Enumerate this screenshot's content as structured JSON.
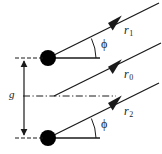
{
  "figure": {
    "background_color": "#ffffff",
    "line_color": "#1a1a1a",
    "source_color": "#000000",
    "width": 162,
    "height": 154
  },
  "labels": {
    "ray_upper": {
      "symbol": "r",
      "subscript": "1",
      "text": "r1"
    },
    "ray_center": {
      "symbol": "r",
      "subscript": "0",
      "text": "r0"
    },
    "ray_lower": {
      "symbol": "r",
      "subscript": "2",
      "text": "r2"
    },
    "gap": {
      "text": "g"
    },
    "angle_upper": {
      "text": "ϕ"
    },
    "angle_lower": {
      "text": "ϕ"
    }
  },
  "elements": {
    "source_upper": {
      "name": "upper point source",
      "cx": 48,
      "cy": 58,
      "r": 8
    },
    "source_lower": {
      "name": "lower point source",
      "cx": 48,
      "cy": 138,
      "r": 8
    },
    "axis_center": {
      "name": "optical axis centre line",
      "y": 96,
      "style": "dash-dot"
    },
    "dimension_line": {
      "name": "gap dimension line",
      "x": 24,
      "y_top": 58,
      "y_bottom": 138
    }
  }
}
